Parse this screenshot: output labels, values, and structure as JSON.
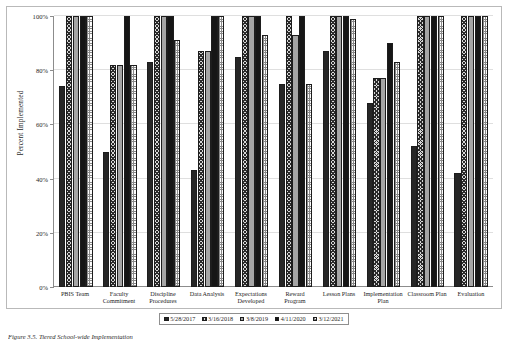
{
  "chart_data": {
    "type": "bar",
    "title": "",
    "xlabel": "",
    "ylabel": "Percent Implemented",
    "ylim": [
      0,
      100
    ],
    "ytick_labels": [
      "0%",
      "20%",
      "40%",
      "60%",
      "80%",
      "100%"
    ],
    "ytick_values": [
      0,
      20,
      40,
      60,
      80,
      100
    ],
    "grid": true,
    "legend_position": "bottom-center",
    "categories": [
      "PBIS Team",
      "Faculty Commitment",
      "Discipline Procedures",
      "Data Analysis",
      "Expectations Developed",
      "Reward Program",
      "Lesson Plans",
      "Implementation Plan",
      "Classroom Plan",
      "Evaluation"
    ],
    "series": [
      {
        "name": "5/28/2017",
        "values": [
          74,
          50,
          83,
          43,
          85,
          75,
          87,
          68,
          52,
          42
        ]
      },
      {
        "name": "3/16/2018",
        "values": [
          100,
          82,
          100,
          87,
          100,
          100,
          100,
          77,
          100,
          100
        ]
      },
      {
        "name": "3/8/2019",
        "values": [
          100,
          82,
          100,
          87,
          100,
          93,
          100,
          77,
          100,
          100
        ]
      },
      {
        "name": "4/11/2020",
        "values": [
          100,
          100,
          100,
          100,
          100,
          100,
          100,
          90,
          100,
          100
        ]
      },
      {
        "name": "3/12/2021",
        "values": [
          100,
          82,
          91,
          100,
          93,
          75,
          99,
          83,
          100,
          100
        ]
      }
    ]
  },
  "caption": "Figure 3.5. Tiered School-wide Implementation",
  "legend": {
    "items": [
      "5/28/2017",
      "3/16/2018",
      "3/8/2019",
      "4/11/2020",
      "3/12/2021"
    ]
  }
}
